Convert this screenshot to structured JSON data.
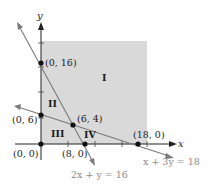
{
  "diagram": {
    "type": "linear-programming-feasible-region",
    "axes": {
      "x_label": "x",
      "y_label": "y"
    },
    "shaded_region_color": "#d9d9d9",
    "line_color": "#7a7a7a",
    "axis_color": "#222222",
    "lines": [
      {
        "equation": "2x + y = 16",
        "label": "2x + y = 16"
      },
      {
        "equation": "x + 3y = 18",
        "label": "x + 3y = 18"
      }
    ],
    "points": [
      {
        "label": "(0, 16)",
        "x": 0,
        "y": 16
      },
      {
        "label": "(0, 6)",
        "x": 0,
        "y": 6
      },
      {
        "label": "(6, 4)",
        "x": 6,
        "y": 4
      },
      {
        "label": "(0, 0)",
        "x": 0,
        "y": 0
      },
      {
        "label": "(8, 0)",
        "x": 8,
        "y": 0
      },
      {
        "label": "(18, 0)",
        "x": 18,
        "y": 0
      }
    ],
    "regions": [
      {
        "label": "I"
      },
      {
        "label": "II"
      },
      {
        "label": "III"
      },
      {
        "label": "IV"
      }
    ]
  }
}
